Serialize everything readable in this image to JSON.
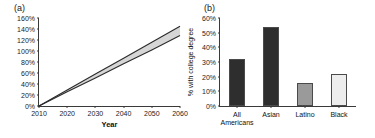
{
  "figure": {
    "panel_a_label": "(a)",
    "panel_b_label": "(b)"
  },
  "chart_data": [
    {
      "type": "line",
      "panel": "(a)",
      "title": "",
      "xlabel": "Year",
      "ylabel": "",
      "xlim": [
        2010,
        2060
      ],
      "ylim": [
        0,
        160
      ],
      "grid": false,
      "legend": "none",
      "xticks": [
        "2010",
        "2020",
        "2030",
        "2040",
        "2050",
        "2060"
      ],
      "xtick_values": [
        2010,
        2020,
        2030,
        2040,
        2050,
        2060
      ],
      "yticks": [
        "0%",
        "20%",
        "40%",
        "60%",
        "80%",
        "100%",
        "120%",
        "140%",
        "160%"
      ],
      "ytick_values": [
        0,
        20,
        40,
        60,
        80,
        100,
        120,
        140,
        160
      ],
      "x": [
        2010,
        2020,
        2030,
        2040,
        2050,
        2060
      ],
      "series": [
        {
          "name": "upper bound",
          "values": [
            0,
            29,
            58,
            87,
            116,
            145
          ],
          "color": "#2b2b2b"
        },
        {
          "name": "lower bound",
          "values": [
            0,
            26,
            51,
            77,
            102,
            128
          ],
          "color": "#2b2b2b"
        }
      ],
      "band": {
        "name": "uncertainty band",
        "color": "#d6d6d6",
        "upper": [
          0,
          29,
          58,
          87,
          116,
          145
        ],
        "lower": [
          0,
          26,
          51,
          77,
          102,
          128
        ]
      }
    },
    {
      "type": "bar",
      "panel": "(b)",
      "title": "",
      "xlabel": "",
      "ylabel": "% with college degree",
      "ylim": [
        0,
        60
      ],
      "grid": false,
      "legend": "none",
      "yticks": [
        "0%",
        "10%",
        "20%",
        "30%",
        "40%",
        "50%",
        "60%"
      ],
      "ytick_values": [
        0,
        10,
        20,
        30,
        40,
        50,
        60
      ],
      "categories": [
        "All\nAmericans",
        "Asian",
        "Latino",
        "Black"
      ],
      "values": [
        32,
        54,
        16,
        22
      ],
      "colors": [
        "#2e2e2e",
        "#2e2e2e",
        "#9a9a9a",
        "#ededed"
      ],
      "bar_edge_color": "#4a4a4a"
    }
  ]
}
